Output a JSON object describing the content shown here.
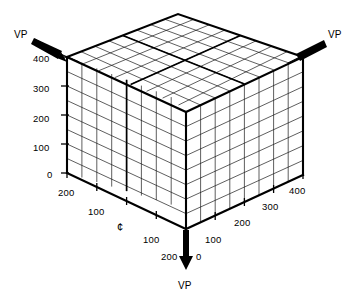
{
  "figure": {
    "type": "perspective-grid-diagram",
    "background_color": "#ffffff",
    "line_color": "#000000",
    "grid_divisions_per_face": 8
  },
  "vanishing_points": [
    {
      "id": "vp-left",
      "label": "VP",
      "label_x": 14,
      "label_y": 30,
      "arrow_from": [
        36,
        42
      ],
      "arrow_to": [
        76,
        60
      ],
      "direction": "down-right"
    },
    {
      "id": "vp-right",
      "label": "VP",
      "label_x": 328,
      "label_y": 30,
      "arrow_from": [
        322,
        42
      ],
      "arrow_to": [
        292,
        58
      ],
      "direction": "up-right"
    },
    {
      "id": "vp-bottom",
      "label": "VP",
      "label_x": 178,
      "label_y": 281,
      "arrow_from": [
        186,
        232
      ],
      "arrow_to": [
        186,
        268
      ],
      "direction": "down"
    }
  ],
  "axes": {
    "vertical": {
      "name": "height-axis",
      "position": "left-edge",
      "ticks": [
        {
          "label": "400",
          "x": 33,
          "y": 54
        },
        {
          "label": "300",
          "x": 33,
          "y": 84
        },
        {
          "label": "200",
          "x": 33,
          "y": 114
        },
        {
          "label": "100",
          "x": 33,
          "y": 143
        },
        {
          "label": "0",
          "x": 47,
          "y": 170
        }
      ]
    },
    "bottom_left": {
      "name": "left-depth-axis",
      "ticks": [
        {
          "label": "200",
          "x": 58,
          "y": 188
        },
        {
          "label": "100",
          "x": 88,
          "y": 207
        },
        {
          "label": "100",
          "x": 143,
          "y": 235
        },
        {
          "label": "200",
          "x": 161,
          "y": 252
        }
      ],
      "centerline": {
        "label": "¢",
        "x": 117,
        "y": 222,
        "name": "centerline-symbol"
      }
    },
    "bottom_right": {
      "name": "right-depth-axis",
      "ticks": [
        {
          "label": "0",
          "x": 196,
          "y": 252
        },
        {
          "label": "100",
          "x": 205,
          "y": 235
        },
        {
          "label": "200",
          "x": 234,
          "y": 218
        },
        {
          "label": "300",
          "x": 262,
          "y": 202
        },
        {
          "label": "400",
          "x": 289,
          "y": 186
        }
      ]
    }
  },
  "cube": {
    "corners": {
      "left_top": [
        67,
        57
      ],
      "back_apex": [
        178,
        14
      ],
      "right_top": [
        303,
        57
      ],
      "front_top": [
        186,
        112
      ],
      "left_bottom": [
        67,
        173
      ],
      "front_bottom": [
        186,
        229
      ],
      "right_bottom": [
        303,
        175
      ]
    }
  }
}
